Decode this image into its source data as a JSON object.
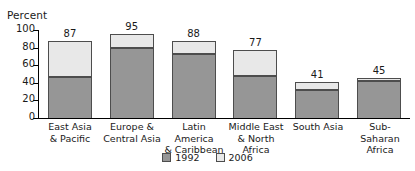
{
  "chart_data": {
    "type": "bar",
    "subtype": "stacked-vertical",
    "title": "",
    "xlabel": "",
    "ylabel": "Percent",
    "ylim": [
      0,
      100
    ],
    "yticks": [
      0,
      20,
      40,
      60,
      80,
      100
    ],
    "ytick_labels": [
      "0",
      "20",
      "40",
      "60",
      "80",
      "100"
    ],
    "grid": false,
    "legend_position": "bottom-center",
    "categories": [
      "East Asia\n& Pacific",
      "Europe &\nCentral Asia",
      "Latin America\n& Caribbean",
      "Middle East\n& North Africa",
      "South Asia",
      "Sub-Saharan\nAfrica"
    ],
    "category_lines": [
      [
        "East Asia",
        "& Pacific"
      ],
      [
        "Europe &",
        "Central Asia"
      ],
      [
        "Latin America",
        "& Caribbean"
      ],
      [
        "Middle East",
        "& North Africa"
      ],
      [
        "South Asia"
      ],
      [
        "Sub-Saharan",
        "Africa"
      ]
    ],
    "series": [
      {
        "name": "1992",
        "color": "#969696",
        "values": [
          47,
          80,
          73,
          48,
          32,
          42
        ]
      },
      {
        "name": "2006",
        "color": "#e8e8e8",
        "values": [
          40,
          15,
          15,
          29,
          9,
          3
        ]
      }
    ],
    "totals": [
      87,
      95,
      88,
      77,
      41,
      45
    ],
    "total_labels": [
      "87",
      "95",
      "88",
      "77",
      "41",
      "45"
    ],
    "annotations": []
  },
  "axis": {
    "y_title": "Percent"
  },
  "legend": {
    "items": [
      {
        "label": "1992",
        "color": "#969696"
      },
      {
        "label": "2006",
        "color": "#e8e8e8"
      }
    ]
  },
  "colors": {
    "series_1992": "#969696",
    "series_2006": "#e8e8e8",
    "bar_outline": "#4d4d4d",
    "axis": "#000000",
    "background": "#ffffff",
    "text": "#1a1a1a"
  }
}
